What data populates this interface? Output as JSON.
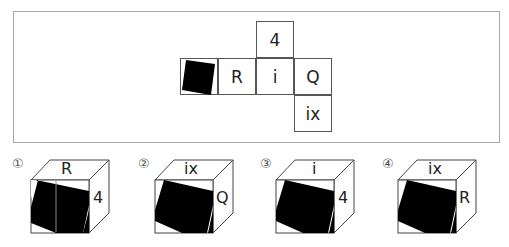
{
  "net": {
    "cells": [
      {
        "id": "top",
        "label": "4",
        "x": 256,
        "y": 21
      },
      {
        "id": "left-pattern",
        "label": "",
        "pattern": "black-tilted-square",
        "x": 180,
        "y": 58
      },
      {
        "id": "r",
        "label": "R",
        "x": 218,
        "y": 58
      },
      {
        "id": "i",
        "label": "i",
        "x": 256,
        "y": 58
      },
      {
        "id": "q",
        "label": "Q",
        "x": 294,
        "y": 58
      },
      {
        "id": "bottom",
        "label": "ix",
        "x": 294,
        "y": 95
      }
    ]
  },
  "options": [
    {
      "number": "①",
      "top": "R",
      "side": "4",
      "front": "black-tilted-square"
    },
    {
      "number": "②",
      "top": "ix",
      "side": "Q",
      "front": "black-tilted-square"
    },
    {
      "number": "③",
      "top": "i",
      "side": "4",
      "front": "black-tilted-square"
    },
    {
      "number": "④",
      "top": "ix",
      "side": "R",
      "front": "black-tilted-square"
    }
  ],
  "colors": {
    "line": "#555555",
    "frame": "#a8a8a8",
    "fill": "#000000"
  }
}
